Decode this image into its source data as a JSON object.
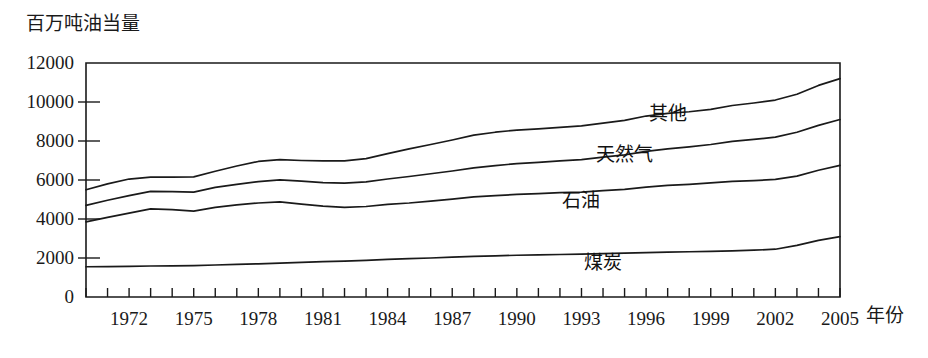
{
  "chart_data": {
    "type": "area",
    "title": "",
    "subtitle": "",
    "ylabel": "百万吨油当量",
    "xlabel": "年份",
    "grid": false,
    "legend_position": "inline-right",
    "stacked": true,
    "xlim": [
      1970,
      2005
    ],
    "ylim": [
      0,
      12000
    ],
    "ytick_labels": [
      "0",
      "2000",
      "4000",
      "6000",
      "8000",
      "10000",
      "12000"
    ],
    "yticks": [
      0,
      2000,
      4000,
      6000,
      8000,
      10000,
      12000
    ],
    "xtick_labels": [
      "1972",
      "1975",
      "1978",
      "1981",
      "1984",
      "1987",
      "1990",
      "1993",
      "1996",
      "1999",
      "2002",
      "2005"
    ],
    "xticks_labeled": [
      1972,
      1975,
      1978,
      1981,
      1984,
      1987,
      1990,
      1993,
      1996,
      1999,
      2002,
      2005
    ],
    "xticks_minor_every": 1,
    "x": [
      1970,
      1971,
      1972,
      1973,
      1974,
      1975,
      1976,
      1977,
      1978,
      1979,
      1980,
      1981,
      1982,
      1983,
      1984,
      1985,
      1986,
      1987,
      1988,
      1989,
      1990,
      1991,
      1992,
      1993,
      1994,
      1995,
      1996,
      1997,
      1998,
      1999,
      2000,
      2001,
      2002,
      2003,
      2004,
      2005
    ],
    "series": [
      {
        "name": "煤炭",
        "label": "煤炭",
        "cumulative_values": [
          1550,
          1560,
          1570,
          1590,
          1600,
          1610,
          1640,
          1670,
          1700,
          1740,
          1780,
          1810,
          1840,
          1880,
          1930,
          1970,
          2000,
          2040,
          2080,
          2110,
          2140,
          2160,
          2180,
          2200,
          2220,
          2250,
          2280,
          2300,
          2320,
          2340,
          2370,
          2400,
          2450,
          2650,
          2900,
          3100
        ]
      },
      {
        "name": "石油",
        "label": "石油",
        "cumulative_values": [
          3850,
          4080,
          4300,
          4520,
          4480,
          4400,
          4600,
          4720,
          4820,
          4880,
          4760,
          4660,
          4600,
          4640,
          4750,
          4820,
          4920,
          5020,
          5130,
          5200,
          5260,
          5300,
          5350,
          5380,
          5450,
          5520,
          5630,
          5720,
          5780,
          5850,
          5930,
          5970,
          6030,
          6200,
          6500,
          6750
        ]
      },
      {
        "name": "天然气",
        "label": "天然气",
        "cumulative_values": [
          4700,
          4960,
          5200,
          5420,
          5400,
          5380,
          5620,
          5780,
          5920,
          6010,
          5940,
          5870,
          5840,
          5900,
          6050,
          6180,
          6320,
          6460,
          6620,
          6740,
          6840,
          6900,
          6980,
          7050,
          7170,
          7290,
          7470,
          7600,
          7700,
          7820,
          7980,
          8080,
          8200,
          8450,
          8800,
          9100
        ]
      },
      {
        "name": "其他",
        "label": "其他",
        "cumulative_values": [
          5500,
          5800,
          6050,
          6150,
          6150,
          6160,
          6450,
          6720,
          6950,
          7040,
          7000,
          6980,
          6980,
          7100,
          7350,
          7600,
          7820,
          8050,
          8300,
          8450,
          8560,
          8620,
          8700,
          8780,
          8920,
          9060,
          9280,
          9420,
          9500,
          9620,
          9820,
          9950,
          10100,
          10400,
          10850,
          11200
        ]
      }
    ],
    "series_label_positions": [
      {
        "name": "其他",
        "x": 1997.0,
        "y": 9100
      },
      {
        "name": "天然气",
        "x": 1995.0,
        "y": 7000
      },
      {
        "name": "石油",
        "x": 1993.0,
        "y": 4600
      },
      {
        "name": "煤炭",
        "x": 1994.0,
        "y": 1450
      }
    ],
    "colors": {
      "line": "#1a1a1a",
      "axis": "#1a1a1a",
      "background": "#ffffff"
    }
  }
}
